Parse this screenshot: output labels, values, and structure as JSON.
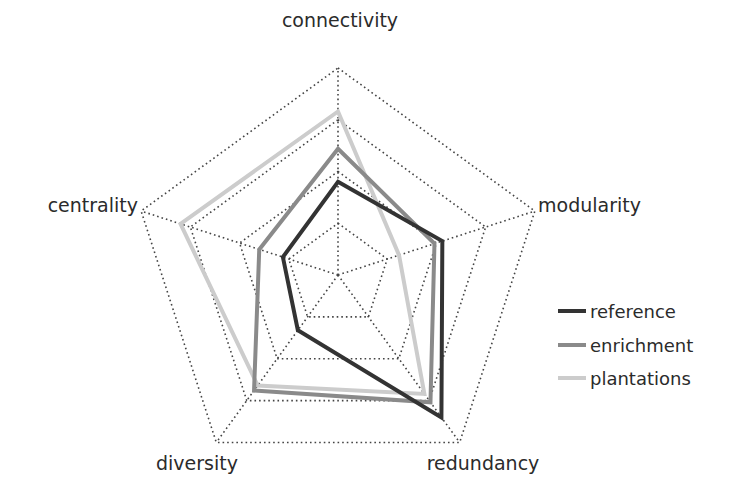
{
  "chart_data": {
    "type": "radar",
    "title": "",
    "axes": [
      "connectivity",
      "modularity",
      "redundancy",
      "diversity",
      "centrality"
    ],
    "rings": 4,
    "range": [
      0,
      1
    ],
    "grid": "dotted",
    "legend_position": "right",
    "series": [
      {
        "name": "reference",
        "color": "#333333",
        "values": [
          0.45,
          0.53,
          0.85,
          0.33,
          0.28
        ]
      },
      {
        "name": "enrichment",
        "color": "#8a8a8a",
        "values": [
          0.61,
          0.49,
          0.76,
          0.69,
          0.4
        ]
      },
      {
        "name": "plantations",
        "color": "#cccccc",
        "values": [
          0.79,
          0.31,
          0.71,
          0.66,
          0.8
        ]
      }
    ]
  },
  "legend": {
    "items": [
      {
        "label": "reference",
        "color": "#333333"
      },
      {
        "label": "enrichment",
        "color": "#8a8a8a"
      },
      {
        "label": "plantations",
        "color": "#cccccc"
      }
    ]
  }
}
